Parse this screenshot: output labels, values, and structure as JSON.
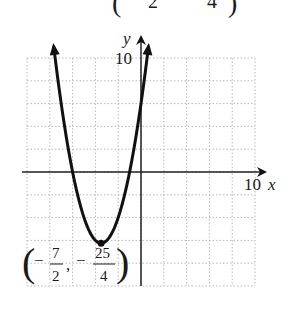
{
  "top_fragment": {
    "open_paren": "(",
    "left_denominator": "2",
    "right_denominator": "4",
    "close_paren": ")"
  },
  "axes": {
    "x_label": "x",
    "y_label": "y",
    "x_tick_label": "10",
    "y_tick_label": "10"
  },
  "vertex_label": {
    "open_paren": "(",
    "minus1": "−",
    "num1": "7",
    "den1": "2",
    "comma": ",",
    "minus2": "−",
    "num2": "25",
    "den2": "4",
    "close_paren": ")"
  },
  "colors": {
    "curve": "#111111",
    "axis": "#222222",
    "grid": "#b8b8b8"
  },
  "chart_data": {
    "type": "line",
    "title": "",
    "function": "y = x^2 + 7x + 6",
    "xlabel": "x",
    "ylabel": "y",
    "xlim": [
      -10,
      10
    ],
    "ylim": [
      -10,
      10
    ],
    "grid": true,
    "grid_step": 2,
    "tick_labels": {
      "x": [
        "10"
      ],
      "y": [
        "10"
      ]
    },
    "vertex": {
      "x": -3.5,
      "y": -6.25,
      "label": "(-7/2, -25/4)"
    },
    "x_intercepts": [
      -6,
      -1
    ],
    "y_intercept": 6,
    "series": [
      {
        "name": "parabola",
        "x": [
          -7.6,
          -7,
          -6,
          -5,
          -4,
          -3.5,
          -3,
          -2,
          -1,
          0,
          0.6
        ],
        "y": [
          10.56,
          6,
          0,
          -4,
          -6,
          -6.25,
          -6,
          -4,
          0,
          6,
          10.56
        ]
      }
    ],
    "annotations": [
      "(-7/2, -25/4)"
    ]
  }
}
